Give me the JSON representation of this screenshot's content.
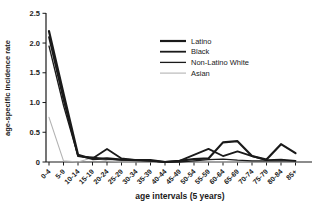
{
  "figure": {
    "background": "#ffffff",
    "axis_color": "#1a1a1a"
  },
  "chart_data": {
    "type": "line",
    "title": "",
    "xlabel": "age intervals (5 years)",
    "ylabel": "age-specific incidence rate",
    "ylim": [
      0,
      2.5
    ],
    "yticks": [
      0,
      0.5,
      1.0,
      1.5,
      2.0,
      2.5
    ],
    "ytick_labels": [
      "0",
      "0.5",
      "1.0",
      "1.5",
      "2.0",
      "2.5"
    ],
    "categories": [
      "0-4",
      "5-9",
      "10-14",
      "15-19",
      "20-24",
      "25-29",
      "30-34",
      "35-39",
      "40-44",
      "45-49",
      "50-54",
      "55-59",
      "60-64",
      "65-69",
      "70-74",
      "75-79",
      "80-84",
      "85+"
    ],
    "grid": false,
    "legend_position": "upper-right-inside",
    "series": [
      {
        "name": "Latino",
        "color": "#1a1a1a",
        "stroke_width": 2.2,
        "values": [
          2.2,
          1.15,
          0.12,
          0.05,
          0.06,
          0.04,
          0.03,
          0.03,
          0.0,
          0.02,
          0.05,
          0.06,
          0.33,
          0.35,
          0.1,
          0.04,
          0.3,
          0.15
        ]
      },
      {
        "name": "Black",
        "color": "#1a1a1a",
        "stroke_width": 1.8,
        "values": [
          2.1,
          1.05,
          0.1,
          0.06,
          0.22,
          0.06,
          0.03,
          0.02,
          0.0,
          0.02,
          0.12,
          0.22,
          0.1,
          0.18,
          0.1,
          0.03,
          0.04,
          0.02
        ]
      },
      {
        "name": "Non-Latino White",
        "color": "#1a1a1a",
        "stroke_width": 1.3,
        "values": [
          1.95,
          0.95,
          0.1,
          0.08,
          0.05,
          0.03,
          0.03,
          0.02,
          0.0,
          0.0,
          0.02,
          0.04,
          0.05,
          0.03,
          0.02,
          0.02,
          0.02,
          0.02
        ]
      },
      {
        "name": "Asian",
        "color": "#b3b3b3",
        "stroke_width": 1.1,
        "values": [
          0.75,
          0.02,
          0.0,
          0.07,
          0.02,
          0.0,
          0.0,
          0.0,
          0.0,
          0.0,
          0.0,
          0.0,
          0.0,
          0.0,
          0.0,
          0.0,
          0.0,
          0.0
        ]
      }
    ]
  }
}
